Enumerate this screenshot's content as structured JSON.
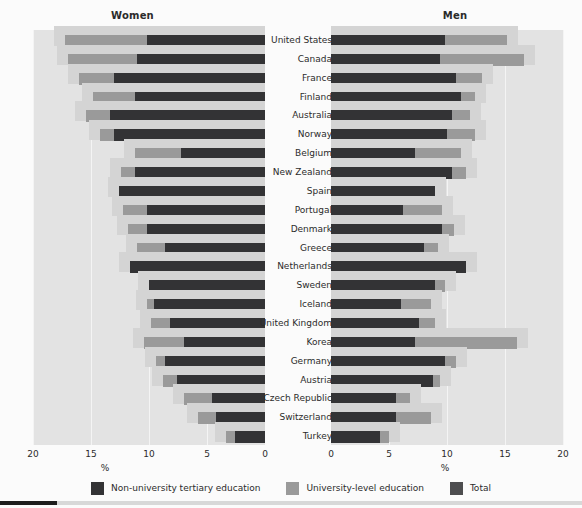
{
  "panels": {
    "left_title": "Women",
    "right_title": "Men"
  },
  "axis": {
    "unit_label": "%",
    "left_ticks": [
      "20",
      "15",
      "10",
      "5",
      "0"
    ],
    "right_ticks": [
      "0",
      "5",
      "10",
      "15",
      "20"
    ]
  },
  "legend": {
    "items": [
      {
        "label": "Non-university tertiary education",
        "color": "#333335",
        "swatch": "nonuni"
      },
      {
        "label": "University-level education",
        "color": "#9a9a9a",
        "swatch": "uni"
      },
      {
        "label": "Total",
        "color": "#4d4d4f",
        "swatch": "total"
      }
    ]
  },
  "colors": {
    "non_university": "#333335",
    "university": "#9a9a9a",
    "total": "#4d4d4f",
    "plot_background": "#e3e3e3",
    "plate": "#d4d4d4"
  },
  "chart_data": {
    "type": "bar",
    "title": "",
    "subtitle": "",
    "xlabel": "%",
    "ylabel": "",
    "xlim": [
      0,
      20
    ],
    "grid": true,
    "legend_position": "bottom",
    "orientation": "horizontal",
    "layout": "back-to-back mirrored panels (Women left, Men right), each country row is a stacked bar of non-university tertiary + university-level education, with a separate 'Total' bar",
    "categories": [
      "United States",
      "Canada",
      "France",
      "Finland",
      "Australia",
      "Norway",
      "Belgium",
      "New Zealand",
      "Spain",
      "Portugal",
      "Denmark",
      "Greece",
      "Netherlands",
      "Sweden",
      "Iceland",
      "United Kingdom",
      "Korea",
      "Germany",
      "Austria",
      "Czech Republic",
      "Switzerland",
      "Turkey"
    ],
    "panels": [
      {
        "name": "Women",
        "series": [
          {
            "name": "Non-university tertiary education",
            "values": [
              10.2,
              11.0,
              13.0,
              11.2,
              13.4,
              13.0,
              7.2,
              11.2,
              12.6,
              10.2,
              10.2,
              8.6,
              11.6,
              10.0,
              9.6,
              8.2,
              7.0,
              8.6,
              7.6,
              4.6,
              4.2,
              2.6
            ]
          },
          {
            "name": "University-level education",
            "values": [
              7.0,
              6.0,
              3.0,
              3.6,
              2.0,
              1.2,
              4.0,
              1.2,
              0.0,
              2.0,
              1.6,
              2.4,
              0.0,
              0.0,
              0.6,
              1.6,
              3.4,
              0.8,
              1.2,
              2.4,
              1.6,
              0.8
            ]
          },
          {
            "name": "Total",
            "values": [
              17.2,
              17.0,
              16.0,
              14.8,
              15.4,
              14.2,
              11.2,
              12.4,
              12.6,
              12.2,
              11.8,
              11.0,
              11.6,
              10.0,
              10.2,
              9.8,
              10.4,
              9.4,
              8.8,
              7.0,
              5.8,
              3.4
            ]
          }
        ]
      },
      {
        "name": "Men",
        "series": [
          {
            "name": "Non-university tertiary education",
            "values": [
              9.8,
              9.4,
              10.8,
              11.2,
              10.4,
              10.0,
              7.2,
              10.4,
              9.0,
              6.2,
              9.6,
              8.0,
              11.6,
              9.0,
              6.0,
              7.6,
              7.2,
              9.8,
              8.8,
              5.6,
              5.6,
              4.2
            ]
          },
          {
            "name": "University-level education",
            "values": [
              5.4,
              7.2,
              2.2,
              1.2,
              1.6,
              2.4,
              4.0,
              1.2,
              0.0,
              3.4,
              1.0,
              1.2,
              0.0,
              0.8,
              2.6,
              1.4,
              8.8,
              1.0,
              0.6,
              1.2,
              3.0,
              0.8
            ]
          },
          {
            "name": "Total",
            "values": [
              15.2,
              16.6,
              13.0,
              12.4,
              12.0,
              12.4,
              11.2,
              11.6,
              9.0,
              9.6,
              10.6,
              9.2,
              11.6,
              9.8,
              8.6,
              9.0,
              16.0,
              10.8,
              9.4,
              6.8,
              8.6,
              5.0
            ]
          }
        ]
      }
    ]
  }
}
